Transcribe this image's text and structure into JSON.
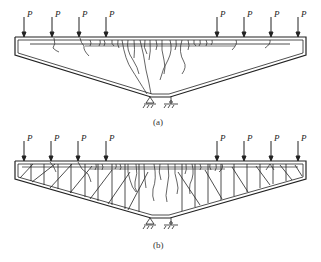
{
  "figure": {
    "panels": [
      {
        "id": "a",
        "caption": "(a)",
        "load_label": "P",
        "load_count": 8,
        "description": "Inverted-trapezoid beam with top-flange cracks, diagonal cracks fanning down toward support"
      },
      {
        "id": "b",
        "caption": "(b)",
        "load_label": "P",
        "load_count": 8,
        "description": "Same beam reinforced with vertical and diagonal web members; cracks distributed"
      }
    ],
    "colors": {
      "line": "#222222",
      "background": "#ffffff"
    }
  }
}
